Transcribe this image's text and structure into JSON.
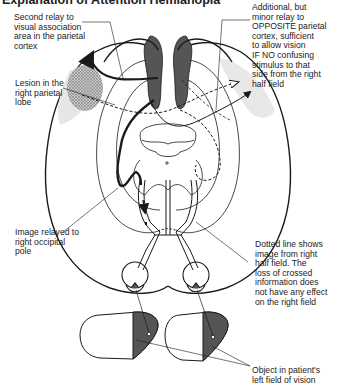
{
  "title": "Explanation of Attention Hemianopia",
  "labels": {
    "second_relay": "Second relay to\nvisual association\narea in the parietal\ncortex",
    "additional_relay": "Additional, but\nminor relay to\nOPPOSITE parietal\ncortex, sufficient\nto allow vision\nIF NO confusing\nstimulus to that\nside from the right\nhalf field",
    "lesion": "Lesion in the\nright parietal\nlobe",
    "image_relayed": "Image relayed to\nright occipital\npole",
    "dotted_line": "Dotted line shows\nimage from right\nhalf field. The\nloss of crossed\ninformation does\nnot have any effect\non the right field",
    "object": "Object in patient's\nleft field of vision"
  },
  "colors": {
    "ink": "#1a1a1a",
    "dark_fill": "#555555",
    "light_shade": "#e6e6e6",
    "lesion_shade": "#b0b0b0"
  }
}
